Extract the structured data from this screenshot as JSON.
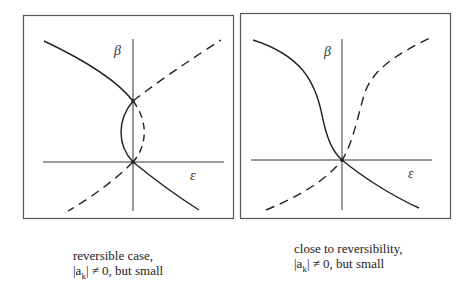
{
  "panels": [
    {
      "axis_y_label": "β",
      "axis_x_label": "ε",
      "caption_line1": "reversible case,",
      "caption_line2": "|a_k| ≠ 0, but small",
      "caption_line2_main": "|a",
      "caption_line2_sub": "k",
      "caption_line2_rest": "| ≠ 0, but small"
    },
    {
      "axis_y_label": "β",
      "axis_x_label": "ε",
      "caption_line1": "close to reversibility,",
      "caption_line2": "|a_k| ≠ 0, but small",
      "caption_line2_main": "|a",
      "caption_line2_sub": "k",
      "caption_line2_rest": "| ≠ 0, but small"
    }
  ],
  "legend": {
    "solid": "stable branch",
    "dashed": "unstable branch"
  }
}
